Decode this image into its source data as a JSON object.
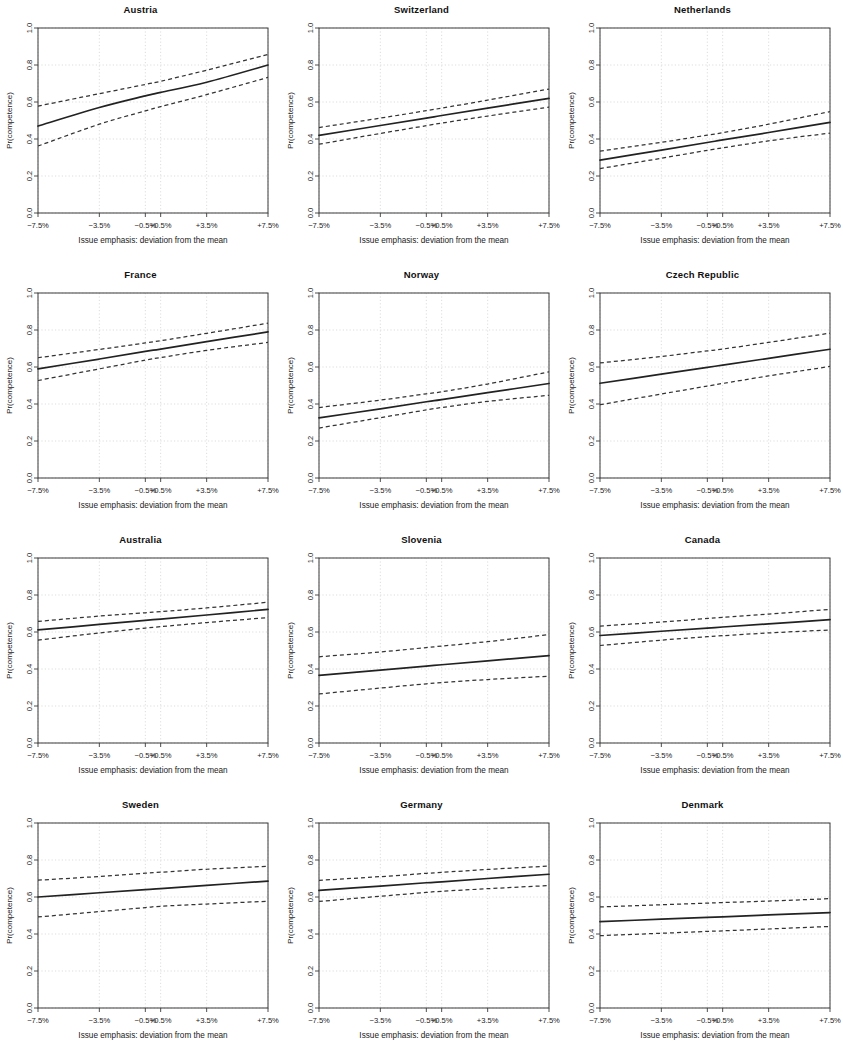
{
  "figure": {
    "kind": "small-multiples-grid",
    "rows": 4,
    "columns": 3,
    "panel_count": 12
  },
  "axes": {
    "x_title": "Issue emphasis: deviation from the mean",
    "y_title": "Pr(competence)",
    "x_tick_labels": [
      "−7.5%",
      "−3.5%",
      "−0.5%",
      "+0.5%",
      "+3.5%",
      "+7.5%"
    ],
    "x_tick_values": [
      -7.5,
      -3.5,
      -0.5,
      0.5,
      3.5,
      7.5
    ],
    "y_tick_labels": [
      "0.0",
      "0.2",
      "0.4",
      "0.6",
      "0.8",
      "1.0"
    ],
    "y_tick_values": [
      0.0,
      0.2,
      0.4,
      0.6,
      0.8,
      1.0
    ],
    "xlim": [
      -7.5,
      7.5
    ],
    "ylim": [
      0.0,
      1.0
    ],
    "grid": true,
    "grid_color": "#cfcfcf",
    "line_color": "#222222",
    "ci_color": "#333333",
    "ci_style": "dashed"
  },
  "chart_data": [
    {
      "type": "line",
      "title": "Austria",
      "xlabel": "Issue emphasis: deviation from the mean",
      "ylabel": "Pr(competence)",
      "xlim": [
        -7.5,
        7.5
      ],
      "ylim": [
        0.0,
        1.0
      ],
      "x": [
        -7.5,
        -3.5,
        -0.5,
        0.5,
        3.5,
        7.5
      ],
      "series": [
        {
          "name": "fit",
          "values": [
            0.47,
            0.57,
            0.633,
            0.652,
            0.707,
            0.8
          ]
        },
        {
          "name": "ci_upper",
          "values": [
            0.578,
            0.645,
            0.695,
            0.712,
            0.772,
            0.857
          ]
        },
        {
          "name": "ci_lower",
          "values": [
            0.362,
            0.48,
            0.552,
            0.575,
            0.64,
            0.733
          ]
        }
      ]
    },
    {
      "type": "line",
      "title": "Switzerland",
      "xlabel": "Issue emphasis: deviation from the mean",
      "ylabel": "Pr(competence)",
      "xlim": [
        -7.5,
        7.5
      ],
      "ylim": [
        0.0,
        1.0
      ],
      "x": [
        -7.5,
        -3.5,
        -0.5,
        0.5,
        3.5,
        7.5
      ],
      "series": [
        {
          "name": "fit",
          "values": [
            0.42,
            0.473,
            0.513,
            0.527,
            0.567,
            0.62
          ]
        },
        {
          "name": "ci_upper",
          "values": [
            0.462,
            0.513,
            0.553,
            0.567,
            0.61,
            0.67
          ]
        },
        {
          "name": "ci_lower",
          "values": [
            0.372,
            0.43,
            0.472,
            0.486,
            0.524,
            0.572
          ]
        }
      ]
    },
    {
      "type": "line",
      "title": "Netherlands",
      "xlabel": "Issue emphasis: deviation from the mean",
      "ylabel": "Pr(competence)",
      "xlim": [
        -7.5,
        7.5
      ],
      "ylim": [
        0.0,
        1.0
      ],
      "x": [
        -7.5,
        -3.5,
        -0.5,
        0.5,
        3.5,
        7.5
      ],
      "series": [
        {
          "name": "fit",
          "values": [
            0.286,
            0.34,
            0.381,
            0.395,
            0.435,
            0.49
          ]
        },
        {
          "name": "ci_upper",
          "values": [
            0.334,
            0.382,
            0.421,
            0.434,
            0.48,
            0.548
          ]
        },
        {
          "name": "ci_lower",
          "values": [
            0.24,
            0.296,
            0.339,
            0.352,
            0.39,
            0.432
          ]
        }
      ]
    },
    {
      "type": "line",
      "title": "France",
      "xlabel": "Issue emphasis: deviation from the mean",
      "ylabel": "Pr(competence)",
      "xlim": [
        -7.5,
        7.5
      ],
      "ylim": [
        0.0,
        1.0
      ],
      "x": [
        -7.5,
        -3.5,
        -0.5,
        0.5,
        3.5,
        7.5
      ],
      "series": [
        {
          "name": "fit",
          "values": [
            0.59,
            0.643,
            0.684,
            0.697,
            0.737,
            0.79
          ]
        },
        {
          "name": "ci_upper",
          "values": [
            0.65,
            0.695,
            0.73,
            0.742,
            0.782,
            0.837
          ]
        },
        {
          "name": "ci_lower",
          "values": [
            0.527,
            0.59,
            0.637,
            0.651,
            0.69,
            0.733
          ]
        }
      ]
    },
    {
      "type": "line",
      "title": "Norway",
      "xlabel": "Issue emphasis: deviation from the mean",
      "ylabel": "Pr(competence)",
      "xlim": [
        -7.5,
        7.5
      ],
      "ylim": [
        0.0,
        1.0
      ],
      "x": [
        -7.5,
        -3.5,
        -0.5,
        0.5,
        3.5,
        7.5
      ],
      "series": [
        {
          "name": "fit",
          "values": [
            0.325,
            0.374,
            0.412,
            0.424,
            0.461,
            0.511
          ]
        },
        {
          "name": "ci_upper",
          "values": [
            0.381,
            0.421,
            0.455,
            0.466,
            0.508,
            0.574
          ]
        },
        {
          "name": "ci_lower",
          "values": [
            0.27,
            0.326,
            0.368,
            0.381,
            0.414,
            0.447
          ]
        }
      ]
    },
    {
      "type": "line",
      "title": "Czech Republic",
      "xlabel": "Issue emphasis: deviation from the mean",
      "ylabel": "Pr(competence)",
      "xlim": [
        -7.5,
        7.5
      ],
      "ylim": [
        0.0,
        1.0
      ],
      "x": [
        -7.5,
        -3.5,
        -0.5,
        0.5,
        3.5,
        7.5
      ],
      "series": [
        {
          "name": "fit",
          "values": [
            0.512,
            0.561,
            0.598,
            0.61,
            0.647,
            0.696
          ]
        },
        {
          "name": "ci_upper",
          "values": [
            0.622,
            0.657,
            0.687,
            0.697,
            0.733,
            0.783
          ]
        },
        {
          "name": "ci_lower",
          "values": [
            0.396,
            0.454,
            0.497,
            0.511,
            0.552,
            0.603
          ]
        }
      ]
    },
    {
      "type": "line",
      "title": "Australia",
      "xlabel": "Issue emphasis: deviation from the mean",
      "ylabel": "Pr(competence)",
      "xlim": [
        -7.5,
        7.5
      ],
      "ylim": [
        0.0,
        1.0
      ],
      "x": [
        -7.5,
        -3.5,
        -0.5,
        0.5,
        3.5,
        7.5
      ],
      "series": [
        {
          "name": "fit",
          "values": [
            0.611,
            0.641,
            0.663,
            0.67,
            0.692,
            0.722
          ]
        },
        {
          "name": "ci_upper",
          "values": [
            0.657,
            0.686,
            0.704,
            0.71,
            0.73,
            0.761
          ]
        },
        {
          "name": "ci_lower",
          "values": [
            0.556,
            0.595,
            0.621,
            0.629,
            0.651,
            0.678
          ]
        }
      ]
    },
    {
      "type": "line",
      "title": "Slovenia",
      "xlabel": "Issue emphasis: deviation from the mean",
      "ylabel": "Pr(competence)",
      "xlim": [
        -7.5,
        7.5
      ],
      "ylim": [
        0.0,
        1.0
      ],
      "x": [
        -7.5,
        -3.5,
        -0.5,
        0.5,
        3.5,
        7.5
      ],
      "series": [
        {
          "name": "fit",
          "values": [
            0.366,
            0.394,
            0.416,
            0.423,
            0.444,
            0.472
          ]
        },
        {
          "name": "ci_upper",
          "values": [
            0.466,
            0.492,
            0.516,
            0.524,
            0.548,
            0.586
          ]
        },
        {
          "name": "ci_lower",
          "values": [
            0.265,
            0.297,
            0.32,
            0.327,
            0.343,
            0.361
          ]
        }
      ]
    },
    {
      "type": "line",
      "title": "Canada",
      "xlabel": "Issue emphasis: deviation from the mean",
      "ylabel": "Pr(competence)",
      "xlim": [
        -7.5,
        7.5
      ],
      "ylim": [
        0.0,
        1.0
      ],
      "x": [
        -7.5,
        -3.5,
        -0.5,
        0.5,
        3.5,
        7.5
      ],
      "series": [
        {
          "name": "fit",
          "values": [
            0.581,
            0.604,
            0.621,
            0.627,
            0.644,
            0.667
          ]
        },
        {
          "name": "ci_upper",
          "values": [
            0.632,
            0.654,
            0.673,
            0.679,
            0.697,
            0.722
          ]
        },
        {
          "name": "ci_lower",
          "values": [
            0.527,
            0.556,
            0.575,
            0.58,
            0.595,
            0.611
          ]
        }
      ]
    },
    {
      "type": "line",
      "title": "Sweden",
      "xlabel": "Issue emphasis: deviation from the mean",
      "ylabel": "Pr(competence)",
      "xlim": [
        -7.5,
        7.5
      ],
      "ylim": [
        0.0,
        1.0
      ],
      "x": [
        -7.5,
        -3.5,
        -0.5,
        0.5,
        3.5,
        7.5
      ],
      "series": [
        {
          "name": "fit",
          "values": [
            0.6,
            0.623,
            0.64,
            0.645,
            0.663,
            0.686
          ]
        },
        {
          "name": "ci_upper",
          "values": [
            0.691,
            0.711,
            0.729,
            0.734,
            0.75,
            0.766
          ]
        },
        {
          "name": "ci_lower",
          "values": [
            0.492,
            0.521,
            0.543,
            0.55,
            0.562,
            0.577
          ]
        }
      ]
    },
    {
      "type": "line",
      "title": "Germany",
      "xlabel": "Issue emphasis: deviation from the mean",
      "ylabel": "Pr(competence)",
      "xlim": [
        -7.5,
        7.5
      ],
      "ylim": [
        0.0,
        1.0
      ],
      "x": [
        -7.5,
        -3.5,
        -0.5,
        0.5,
        3.5,
        7.5
      ],
      "series": [
        {
          "name": "fit",
          "values": [
            0.636,
            0.659,
            0.677,
            0.682,
            0.7,
            0.723
          ]
        },
        {
          "name": "ci_upper",
          "values": [
            0.69,
            0.71,
            0.728,
            0.733,
            0.749,
            0.767
          ]
        },
        {
          "name": "ci_lower",
          "values": [
            0.576,
            0.604,
            0.625,
            0.631,
            0.645,
            0.662
          ]
        }
      ]
    },
    {
      "type": "line",
      "title": "Denmark",
      "xlabel": "Issue emphasis: deviation from the mean",
      "ylabel": "Pr(competence)",
      "xlim": [
        -7.5,
        7.5
      ],
      "ylim": [
        0.0,
        1.0
      ],
      "x": [
        -7.5,
        -3.5,
        -0.5,
        0.5,
        3.5,
        7.5
      ],
      "series": [
        {
          "name": "fit",
          "values": [
            0.467,
            0.48,
            0.49,
            0.493,
            0.503,
            0.516
          ]
        },
        {
          "name": "ci_upper",
          "values": [
            0.546,
            0.558,
            0.567,
            0.57,
            0.578,
            0.591
          ]
        },
        {
          "name": "ci_lower",
          "values": [
            0.391,
            0.404,
            0.414,
            0.417,
            0.427,
            0.441
          ]
        }
      ]
    }
  ]
}
